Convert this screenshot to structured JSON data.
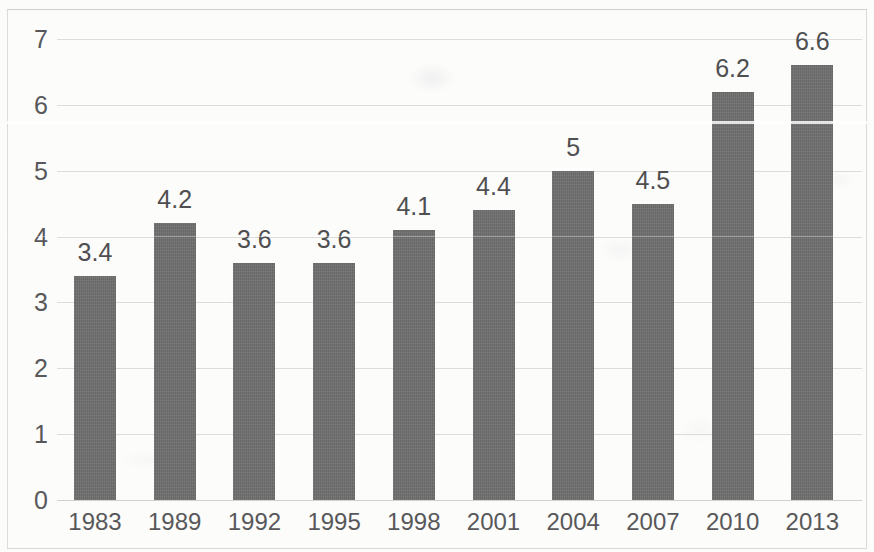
{
  "chart_data": {
    "type": "bar",
    "title": "",
    "subtitle": "",
    "xlabel": "",
    "ylabel": "",
    "categories": [
      "1983",
      "1989",
      "1992",
      "1995",
      "1998",
      "2001",
      "2004",
      "2007",
      "2010",
      "2013"
    ],
    "values": [
      3.4,
      4.2,
      3.6,
      3.6,
      4.1,
      4.4,
      5,
      4.5,
      6.2,
      6.6
    ],
    "data_labels": [
      "3.4",
      "4.2",
      "3.6",
      "3.6",
      "4.1",
      "4.4",
      "5",
      "4.5",
      "6.2",
      "6.6"
    ],
    "series": [
      {
        "name": "",
        "values": [
          3.4,
          4.2,
          3.6,
          3.6,
          4.1,
          4.4,
          5,
          4.5,
          6.2,
          6.6
        ]
      }
    ],
    "ylim": [
      0,
      7
    ],
    "y_ticks": [
      "0",
      "1",
      "2",
      "3",
      "4",
      "5",
      "6",
      "7"
    ],
    "y_tick_values": [
      0,
      1,
      2,
      3,
      4,
      5,
      6,
      7
    ],
    "grid": true,
    "grid_axis": "y",
    "legend": false,
    "legend_position": "none",
    "bar_color": "#6f6f6f",
    "grid_color": "#dcdcd9",
    "text_color": "#58585a",
    "background_color": "#fcfcfb"
  }
}
